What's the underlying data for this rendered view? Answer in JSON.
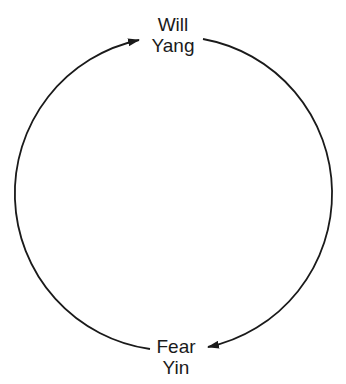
{
  "diagram": {
    "type": "cycle",
    "nodes": [
      {
        "id": "top",
        "line1": "Will",
        "line2": "Yang"
      },
      {
        "id": "bottom",
        "line1": "Fear",
        "line2": "Yin"
      }
    ],
    "edges": [
      {
        "from": "bottom",
        "to": "top",
        "side": "left",
        "direction": "clockwise"
      },
      {
        "from": "top",
        "to": "bottom",
        "side": "right",
        "direction": "clockwise"
      }
    ],
    "colors": {
      "stroke": "#1a1a1a",
      "background": "#ffffff"
    }
  }
}
